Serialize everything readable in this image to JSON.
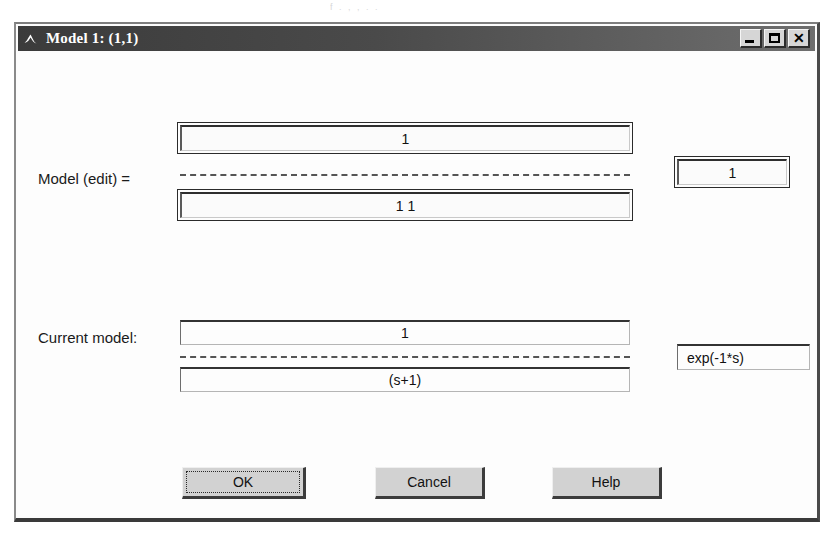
{
  "window": {
    "title": "Model 1: (1,1)",
    "icon": "matlab-membrane-icon",
    "controls": {
      "minimize": "minimize-icon",
      "maximize": "maximize-icon",
      "close": "✕"
    }
  },
  "edit_section": {
    "label": "Model   (edit) =",
    "numerator": "1",
    "denominator": "1 1",
    "delay": "1"
  },
  "current_section": {
    "label": "Current model:",
    "numerator": "1",
    "denominator": "(s+1)",
    "delay": "exp(-1*s)"
  },
  "buttons": {
    "ok": "OK",
    "cancel": "Cancel",
    "help": "Help"
  },
  "artifact": {
    "line": "f . , ,                 .                 ."
  },
  "colors": {
    "titlebar": "#4a4a4a",
    "client": "#fdfdfd",
    "button_face": "#d2d2d2",
    "text": "#111111"
  }
}
